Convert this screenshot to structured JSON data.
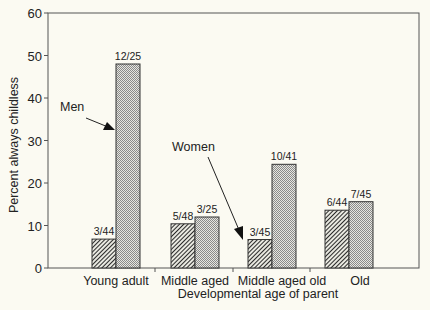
{
  "chart_data": {
    "type": "bar",
    "title": "",
    "xlabel": "Developmental age of parent",
    "ylabel": "Percent always childless",
    "ylim": [
      0,
      60
    ],
    "yticks": [
      0,
      10,
      20,
      30,
      40,
      50,
      60
    ],
    "grid": false,
    "legend": "none (inline arrow annotations)",
    "categories": [
      "Young adult",
      "Middle aged",
      "Middle aged old",
      "Old"
    ],
    "series": [
      {
        "name": "Women",
        "pattern": "diagonal hatch (dark)",
        "values": [
          6.8,
          10.4,
          6.7,
          13.6
        ],
        "labels": [
          "3/44",
          "5/48",
          "3/45",
          "6/44"
        ]
      },
      {
        "name": "Men",
        "pattern": "dotted (light)",
        "values": [
          48.0,
          12.0,
          24.4,
          15.6
        ],
        "labels": [
          "12/25",
          "3/25",
          "10/41",
          "7/45"
        ]
      }
    ],
    "annotations": [
      {
        "text": "Men",
        "points_to": "Young adult / Men bar"
      },
      {
        "text": "Women",
        "points_to": "Middle aged old / Women bar"
      }
    ]
  },
  "colors": {
    "background": "#fbfaf2",
    "axis": "#333333",
    "women_fill": "#555555",
    "men_fill": "#c8c8c8"
  }
}
